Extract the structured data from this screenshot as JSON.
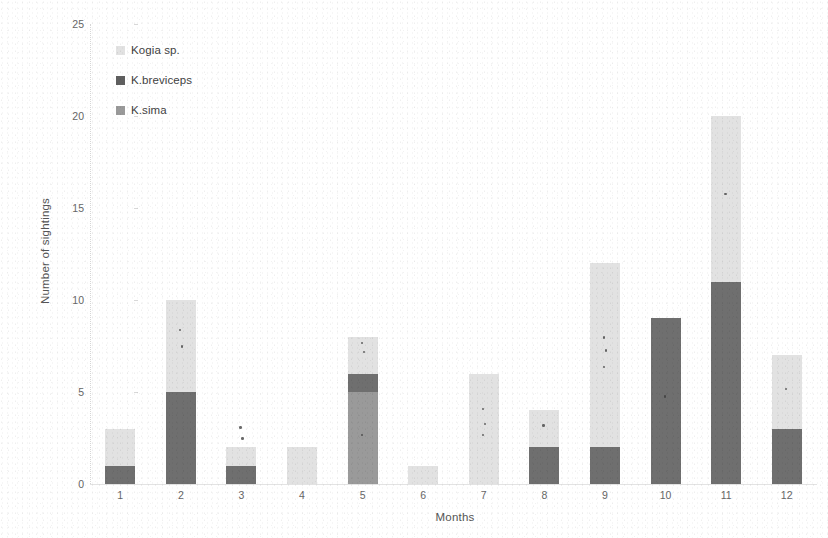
{
  "chart_data": {
    "type": "bar",
    "stacked": true,
    "title": "",
    "xlabel": "Months",
    "ylabel": "Number of sightings",
    "categories": [
      "1",
      "2",
      "3",
      "4",
      "5",
      "6",
      "7",
      "8",
      "9",
      "10",
      "11",
      "12"
    ],
    "ylim": [
      0,
      25
    ],
    "yticks": [
      0,
      5,
      10,
      15,
      20,
      25
    ],
    "grid": false,
    "legend_position": "upper-left-inside",
    "series": [
      {
        "name": "K.sima",
        "color": "#9a9a9a",
        "values": [
          0,
          0,
          0,
          0,
          5,
          0,
          0,
          0,
          0,
          0,
          0,
          0
        ]
      },
      {
        "name": "K.breviceps",
        "color": "#6f6f6f",
        "values": [
          1,
          5,
          1,
          0,
          1,
          0,
          0,
          2,
          2,
          9,
          11,
          3
        ]
      },
      {
        "name": "Kogia sp.",
        "color": "#e2e2e2",
        "values": [
          2,
          5,
          1,
          2,
          2,
          1,
          6,
          2,
          10,
          0,
          9,
          4
        ]
      }
    ],
    "totals": [
      3,
      10,
      2,
      2,
      8,
      1,
      6,
      4,
      12,
      9,
      20,
      7
    ]
  },
  "axes": {
    "y_title": "Number of sightings",
    "x_title": "Months",
    "y_tick_labels": [
      "25",
      "20",
      "15",
      "10",
      "5",
      "0"
    ],
    "x_tick_labels": [
      "1",
      "2",
      "3",
      "4",
      "5",
      "6",
      "7",
      "8",
      "9",
      "10",
      "11",
      "12"
    ]
  },
  "legend": {
    "items": [
      {
        "label": "Kogia sp.",
        "swatch": "legend-swatch-kogia-sp",
        "color": "#e2e2e2"
      },
      {
        "label": "K.breviceps",
        "swatch": "legend-swatch-k-breviceps",
        "color": "#5f5f5f"
      },
      {
        "label": "K.sima",
        "swatch": "legend-swatch-k-sima",
        "color": "#9a9a9a"
      }
    ]
  },
  "colors": {
    "kogia_sp": "#e2e2e2",
    "k_breviceps": "#6f6f6f",
    "k_sima": "#9a9a9a",
    "axis": "#d6d6d6",
    "text": "#555555",
    "background": "#ffffff"
  }
}
